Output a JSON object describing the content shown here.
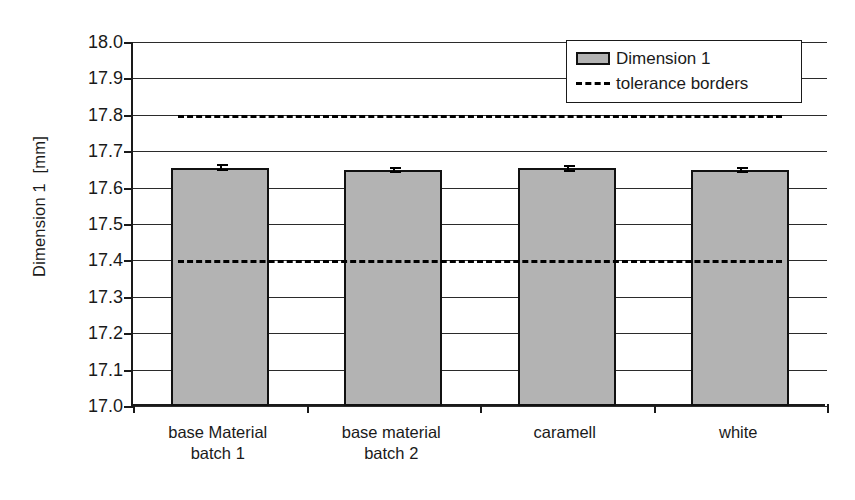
{
  "chart_data": {
    "type": "bar",
    "title": "",
    "xlabel": "",
    "ylabel": "Dimension 1  [mm]",
    "ylim": [
      17.0,
      18.0
    ],
    "ytick_step": 0.1,
    "ytick_labels": [
      "18.0",
      "17.9",
      "17.8",
      "17.7",
      "17.6",
      "17.5",
      "17.4",
      "17.3",
      "17.2",
      "17.1",
      "17.0"
    ],
    "ytick_values": [
      18.0,
      17.9,
      17.8,
      17.7,
      17.6,
      17.5,
      17.4,
      17.3,
      17.2,
      17.1,
      17.0
    ],
    "grid": true,
    "legend_position": "top-right",
    "categories": [
      "base Material\nbatch 1",
      "base material\nbatch 2",
      "caramell",
      "white"
    ],
    "series": [
      {
        "name": "Dimension 1",
        "type": "bar",
        "color": "#b3b3b3",
        "edge_color": "#111111",
        "values": [
          17.655,
          17.648,
          17.653,
          17.648
        ],
        "errors": [
          0.006,
          0.006,
          0.007,
          0.006
        ]
      }
    ],
    "reference_lines": [
      {
        "name": "tolerance borders",
        "label": "upper tolerance border",
        "value": 17.8,
        "style": "dashed",
        "color": "#000000"
      },
      {
        "name": "tolerance borders",
        "label": "lower tolerance border",
        "value": 17.4,
        "style": "dashed",
        "color": "#000000"
      }
    ],
    "legend": [
      {
        "label": "Dimension 1",
        "marker": "filled-gray-swatch"
      },
      {
        "label": "tolerance borders",
        "marker": "dashed-line"
      }
    ]
  }
}
